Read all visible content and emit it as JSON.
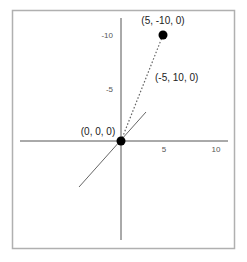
{
  "diagram": {
    "type": "coordinate-vector-diagram",
    "axes": {
      "x_ticks": [
        {
          "label": "5",
          "value": 5
        },
        {
          "label": "10",
          "value": 10
        }
      ],
      "y_ticks": [
        {
          "label": "-5",
          "value": -5
        },
        {
          "label": "-10",
          "value": -10
        }
      ]
    },
    "points": [
      {
        "id": "origin",
        "label": "(0, 0, 0)",
        "coords": [
          0,
          0,
          0
        ]
      },
      {
        "id": "p1",
        "label": "(5, -10, 0)",
        "coords": [
          5,
          -10,
          0
        ]
      }
    ],
    "vector": {
      "label": "(-5, 10, 0)",
      "style": "dotted",
      "from": "origin",
      "to": "p1"
    },
    "colors": {
      "frame": "#b0b0b0",
      "axis": "#555555",
      "diagonal_axis": "#666666",
      "point": "#000000",
      "vector": "#666666"
    }
  }
}
